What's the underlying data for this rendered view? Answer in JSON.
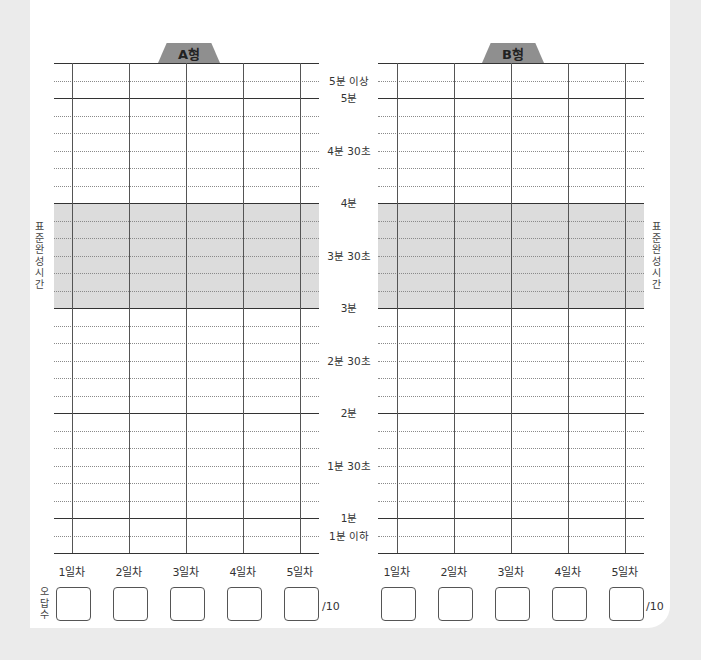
{
  "sheet": {
    "charts": [
      {
        "id": "A",
        "title": "A형",
        "days": [
          "1일차",
          "2일차",
          "3일차",
          "4일차",
          "5일차"
        ],
        "answer_boxes": 5,
        "denominator": "/10"
      },
      {
        "id": "B",
        "title": "B형",
        "days": [
          "1일차",
          "2일차",
          "3일차",
          "4일차",
          "5일차"
        ],
        "answer_boxes": 5,
        "denominator": "/10"
      }
    ],
    "y_axis_labels": [
      "5분 이상",
      "5분",
      "4분 30초",
      "4분",
      "3분 30초",
      "3분",
      "2분 30초",
      "2분",
      "1분 30초",
      "1분",
      "1분 이하"
    ],
    "standard_time_label": [
      "표",
      "준",
      "완",
      "성",
      "시",
      "간"
    ],
    "wrong_answers_label": [
      "오",
      "답",
      "수"
    ],
    "standard_time_range": [
      "3분",
      "4분"
    ]
  },
  "colors": {
    "shade": "#dcdcdc",
    "tab": "#8f8f8f",
    "background": "#ebebeb"
  }
}
